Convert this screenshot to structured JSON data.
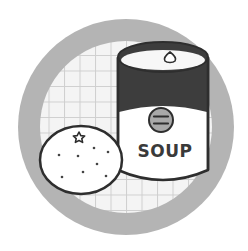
{
  "illustration": {
    "subject": "soup can and orange",
    "can_label_text": "SOUP",
    "badge_symbol": "=",
    "icons": [
      "soup-can-icon",
      "orange-icon",
      "star-icon",
      "drop-icon",
      "grid-pattern"
    ]
  },
  "colors": {
    "background": "#ffffff",
    "outer_ring": "#b4b4b4",
    "grid_fill": "#f4f4f4",
    "grid_line": "#cfcfcf",
    "outline": "#2e2e2e",
    "can_band": "#3d3d3d",
    "badge_fill": "#a9a9a9",
    "can_body": "#ffffff",
    "orange_fill": "#ffffff"
  }
}
